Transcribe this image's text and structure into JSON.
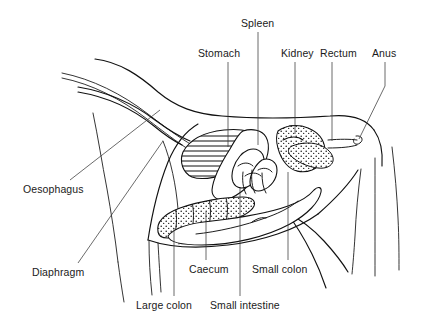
{
  "figure": {
    "style": "line drawing",
    "background_color": "#ffffff",
    "line_color": "#111111",
    "text_color": "#1a1a1a"
  },
  "labels": {
    "spleen": "Spleen",
    "stomach": "Stomach",
    "kidney": "Kidney",
    "rectum": "Rectum",
    "anus": "Anus",
    "oesophagus": "Oesophagus",
    "diaphragm": "Diaphragm",
    "caecum": "Caecum",
    "small_colon": "Small colon",
    "large_colon": "Large colon",
    "small_intestine": "Small intestine"
  },
  "label_positions": [
    {
      "name": "spleen",
      "text": "Spleen",
      "x": 241,
      "y": 18,
      "leader_to_x": 258,
      "leader_to_y": 145
    },
    {
      "name": "stomach",
      "text": "Stomach",
      "x": 198,
      "y": 48,
      "leader_to_x": 228,
      "leader_to_y": 147
    },
    {
      "name": "kidney",
      "text": "Kidney",
      "x": 281,
      "y": 48,
      "leader_to_x": 295,
      "leader_to_y": 134
    },
    {
      "name": "rectum",
      "text": "Rectum",
      "x": 320,
      "y": 48,
      "leader_to_x": 332,
      "leader_to_y": 141
    },
    {
      "name": "anus",
      "text": "Anus",
      "x": 372,
      "y": 48,
      "leader_to_x": 359,
      "leader_to_y": 139
    },
    {
      "name": "oesophagus",
      "text": "Oesophagus",
      "x": 23,
      "y": 184,
      "leader_to_x": 160,
      "leader_to_y": 110
    },
    {
      "name": "diaphragm",
      "text": "Diaphragm",
      "x": 32,
      "y": 267,
      "leader_to_x": 163,
      "leader_to_y": 141
    },
    {
      "name": "caecum",
      "text": "Caecum",
      "x": 189,
      "y": 264,
      "leader_to_x": 178,
      "leader_to_y": 210
    },
    {
      "name": "small_colon",
      "text": "Small colon",
      "x": 252,
      "y": 264,
      "leader_to_x": 288,
      "leader_to_y": 172
    },
    {
      "name": "large_colon",
      "text": "Large colon",
      "x": 136,
      "y": 300,
      "leader_to_x": 174,
      "leader_to_y": 228
    },
    {
      "name": "small_intestine",
      "text": "Small intestine",
      "x": 210,
      "y": 300,
      "leader_to_x": 238,
      "leader_to_y": 188
    }
  ],
  "organs": [
    {
      "name": "stomach",
      "texture": "horizontal-hatch",
      "description": "sac with horizontal hatch lines, upper left of abdomen"
    },
    {
      "name": "spleen",
      "texture": "plain",
      "description": "elongated smooth organ lying alongside stomach"
    },
    {
      "name": "kidney",
      "texture": "plain",
      "description": "bean-shaped organ upper right"
    },
    {
      "name": "small_colon",
      "texture": "stipple",
      "description": "dotted sacculated tube running to rectum"
    },
    {
      "name": "rectum",
      "texture": "plain",
      "description": "straight tube exiting at anus"
    },
    {
      "name": "large_colon",
      "texture": "stipple",
      "description": "large dotted sacculated loop along ventral floor"
    },
    {
      "name": "caecum",
      "texture": "plain",
      "description": "large comma shaped sac, centre-ventral"
    },
    {
      "name": "small_intestine",
      "texture": "plain",
      "description": "coiled loops mid abdomen"
    },
    {
      "name": "oesophagus",
      "texture": "double-line",
      "description": "tube descending through the neck to the stomach"
    },
    {
      "name": "diaphragm",
      "texture": "line",
      "description": "curved partition at front of abdomen"
    }
  ]
}
